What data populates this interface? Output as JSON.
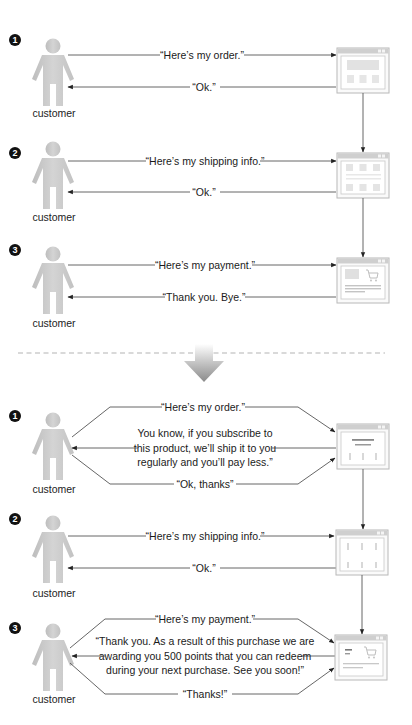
{
  "actor_label": "customer",
  "before": {
    "steps": [
      {
        "number": "1",
        "request": "“Here’s my order.”",
        "response": "“Ok.”",
        "screen": "product-order-page"
      },
      {
        "number": "2",
        "request": "“Here’s my shipping info.”",
        "response": "“Ok.”",
        "screen": "shipping-info-page"
      },
      {
        "number": "3",
        "request": "“Here’s my payment.”",
        "response": "“Thank you. Bye.”",
        "screen": "payment-cart-page"
      }
    ]
  },
  "transition": {
    "icon": "down-arrow-icon",
    "divider": "dashed-line"
  },
  "after": {
    "steps": [
      {
        "number": "1",
        "request": "“Here’s my order.”",
        "response_lines": [
          "You know, if you subscribe to",
          "this product, we’ll ship it to you",
          "regularly and you’ll pay less.”"
        ],
        "reply": "“Ok, thanks”",
        "screen": "product-order-page"
      },
      {
        "number": "2",
        "request": "“Here’s my shipping info.”",
        "response": "“Ok.”",
        "screen": "shipping-info-page"
      },
      {
        "number": "3",
        "request": "“Here’s my payment.”",
        "response_lines": [
          "“Thank you. As a result of this purchase we are",
          "awarding you 500 points that you can redeem",
          "during your next purchase. See you soon!”"
        ],
        "reply": "“Thanks!”",
        "screen": "payment-cart-page"
      }
    ]
  },
  "colors": {
    "line": "#555555",
    "figure": "#c8c8c8",
    "badge": "#111111",
    "window_border": "#b5b5b5",
    "divider": "#aaaaaa"
  }
}
